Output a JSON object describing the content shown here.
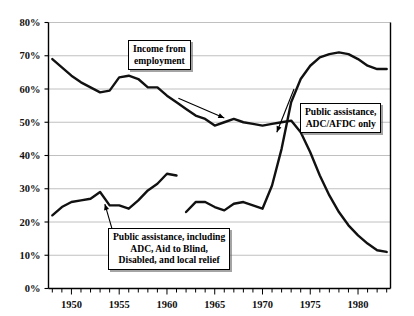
{
  "chart_data": {
    "type": "line",
    "title": "",
    "subtitle": "",
    "xlabel": "",
    "ylabel": "",
    "xlim": [
      1947.6,
      1983.4
    ],
    "ylim": [
      0,
      80
    ],
    "y_tick_values": [
      0,
      10,
      20,
      30,
      40,
      50,
      60,
      70,
      80
    ],
    "y_tick_labels": [
      "0%",
      "10%",
      "20%",
      "30%",
      "40%",
      "50%",
      "60%",
      "70%",
      "80%"
    ],
    "x_tick_values": [
      1950,
      1955,
      1960,
      1965,
      1970,
      1975,
      1980
    ],
    "x_tick_labels": [
      "1950",
      "1955",
      "1960",
      "1965",
      "1970",
      "1975",
      "1980"
    ],
    "x_minor_step": 1,
    "grid": "horizontal",
    "legend": "none",
    "line_color": "#111111",
    "grid_color": "#b9b9b9",
    "axis_color": "#000000",
    "series": [
      {
        "name": "Income from employment",
        "x": [
          1948,
          1949,
          1950,
          1951,
          1952,
          1953,
          1954,
          1955,
          1956,
          1957,
          1958,
          1959,
          1960,
          1961,
          1962,
          1963,
          1964,
          1965,
          1966,
          1967,
          1968,
          1969,
          1970,
          1971,
          1972,
          1973,
          1974,
          1975,
          1976,
          1977,
          1978,
          1979,
          1980,
          1981,
          1982,
          1983
        ],
        "values": [
          69,
          66.5,
          64,
          62,
          60.5,
          59,
          59.5,
          63.5,
          64,
          63,
          60.5,
          60.5,
          58,
          56,
          54,
          52,
          51,
          49,
          50,
          51,
          50,
          49.5,
          49,
          49.5,
          50,
          50.5,
          47,
          41,
          34,
          28,
          23,
          19,
          16,
          13.5,
          11.5,
          11
        ]
      },
      {
        "name": "Public assistance, including ADC, Aid to Blind, Disabled, and local relief",
        "x": [
          1948,
          1949,
          1950,
          1951,
          1952,
          1953,
          1954,
          1955,
          1956,
          1957,
          1958,
          1959,
          1960,
          1961
        ],
        "values": [
          22,
          24.5,
          26,
          26.5,
          27,
          29,
          25,
          25,
          24,
          26.5,
          29.5,
          31.5,
          34.5,
          34
        ]
      },
      {
        "name": "Public assistance, ADC/AFDC only",
        "x": [
          1962,
          1963,
          1964,
          1965,
          1966,
          1967,
          1968,
          1969,
          1970,
          1971,
          1972,
          1973,
          1974,
          1975,
          1976,
          1977,
          1978,
          1979,
          1980,
          1981,
          1982,
          1983
        ],
        "values": [
          23,
          26,
          26,
          24.5,
          23.5,
          25.5,
          26,
          25,
          24,
          31,
          42,
          56,
          63,
          67,
          69.5,
          70.5,
          71,
          70.5,
          69,
          67,
          66,
          66
        ]
      }
    ],
    "annotations": [
      {
        "id": "income-from-employment",
        "lines": [
          "Income from",
          "employment"
        ],
        "arrow_from": [
          1961.2,
          57.2
        ],
        "arrow_to": [
          1966.0,
          51.3
        ]
      },
      {
        "id": "public-assistance-adc-afdc-only",
        "lines": [
          "Public assistance,",
          "ADC/AFDC only"
        ],
        "arrow_from": [
          1973.3,
          60.0
        ],
        "arrow_to": [
          1971.5,
          47.0
        ]
      },
      {
        "id": "public-assistance-including",
        "lines": [
          "Public assistance, including",
          "ADC, Aid to Blind,",
          "Disabled, and local relief"
        ],
        "arrow_from": [
          1954.6,
          14.5
        ],
        "arrow_to": [
          1953.5,
          25.4
        ]
      }
    ]
  }
}
